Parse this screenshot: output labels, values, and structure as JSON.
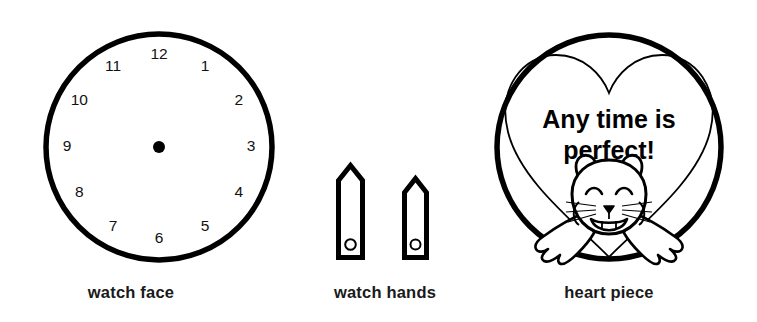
{
  "page": {
    "background_color": "#ffffff",
    "ink_color": "#000000"
  },
  "pieces": [
    {
      "id": "watch-face",
      "caption": "watch face",
      "shape": "circle",
      "numerals": [
        "12",
        "1",
        "2",
        "3",
        "4",
        "5",
        "6",
        "7",
        "8",
        "9",
        "10",
        "11"
      ],
      "center_dot": true
    },
    {
      "id": "watch-hands",
      "caption": "watch hands",
      "shape": "two-pointed-bars",
      "hands": [
        {
          "name": "long-hand",
          "hole": true
        },
        {
          "name": "short-hand",
          "hole": true
        }
      ]
    },
    {
      "id": "heart-piece",
      "caption": "heart piece",
      "shape": "circle-with-heart",
      "message_line1": "Any time is",
      "message_line2": "perfect!",
      "character": "hamster"
    }
  ],
  "captions": {
    "watch_face": "watch face",
    "watch_hands": "watch hands",
    "heart_piece": "heart piece"
  },
  "clock": {
    "numerals": [
      {
        "label": "12",
        "x": 131,
        "y": 131,
        "angle": 0
      },
      {
        "label": "1",
        "x": 131,
        "y": 131,
        "angle": 30
      },
      {
        "label": "2",
        "x": 131,
        "y": 131,
        "angle": 60
      },
      {
        "label": "3",
        "x": 131,
        "y": 131,
        "angle": 90
      },
      {
        "label": "4",
        "x": 131,
        "y": 131,
        "angle": 120
      },
      {
        "label": "5",
        "x": 131,
        "y": 131,
        "angle": 150
      },
      {
        "label": "6",
        "x": 131,
        "y": 131,
        "angle": 180
      },
      {
        "label": "7",
        "x": 131,
        "y": 131,
        "angle": 210
      },
      {
        "label": "8",
        "x": 131,
        "y": 131,
        "angle": 240
      },
      {
        "label": "9",
        "x": 131,
        "y": 131,
        "angle": 270
      },
      {
        "label": "10",
        "x": 131,
        "y": 131,
        "angle": 300
      },
      {
        "label": "11",
        "x": 131,
        "y": 131,
        "angle": 330
      }
    ]
  },
  "heart": {
    "message_line1": "Any time is",
    "message_line2": "perfect!"
  }
}
